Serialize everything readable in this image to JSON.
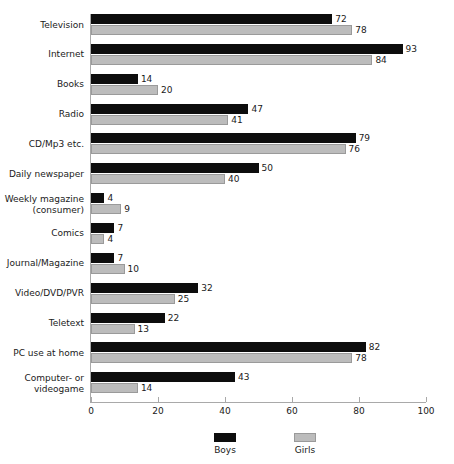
{
  "chart_data": {
    "type": "bar",
    "orientation": "horizontal",
    "title": "",
    "xlabel": "",
    "ylabel": "",
    "xlim": [
      0,
      100
    ],
    "xticks": [
      0,
      20,
      40,
      60,
      80,
      100
    ],
    "grid": false,
    "legend_position": "bottom",
    "categories": [
      "Television",
      "Internet",
      "Books",
      "Radio",
      "CD/Mp3 etc.",
      "Daily newspaper",
      "Weekly magazine\n(consumer)",
      "Comics",
      "Journal/Magazine",
      "Video/DVD/PVR",
      "Teletext",
      "PC use at home",
      "Computer- or\nvideogame"
    ],
    "series": [
      {
        "name": "Boys",
        "color": "#0d0d0d",
        "values": [
          72,
          93,
          14,
          47,
          79,
          50,
          4,
          7,
          7,
          32,
          22,
          82,
          43
        ]
      },
      {
        "name": "Girls",
        "color": "#bcbcbc",
        "values": [
          78,
          84,
          20,
          41,
          76,
          40,
          9,
          4,
          10,
          25,
          13,
          78,
          14
        ]
      }
    ]
  },
  "legend": {
    "entries": [
      {
        "label": "Boys",
        "swatch": "black"
      },
      {
        "label": "Girls",
        "swatch": "gray"
      }
    ]
  },
  "axis": {
    "tick_labels": [
      "0",
      "20",
      "40",
      "60",
      "80",
      "100"
    ]
  },
  "colors": {
    "boys": "#0d0d0d",
    "girls": "#bcbcbc",
    "axis": "#a9a9a9",
    "text": "#1a1a1a",
    "background": "#ffffff"
  }
}
